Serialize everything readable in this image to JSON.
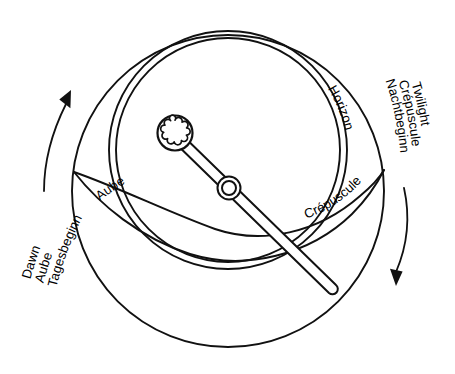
{
  "diagram": {
    "background_color": "#ffffff",
    "stroke_color": "#111111",
    "labels": {
      "horizon": "Horizon",
      "aube": "Aube",
      "crepuscule": "Crépuscule"
    },
    "left_group": {
      "line1": "Dawn",
      "line2": "Aube",
      "line3": "Tagesbeginn",
      "arrow_direction": "up"
    },
    "right_group": {
      "line1": "Twilight",
      "line2": "Crépuscule",
      "line3": "Nachtbeginn",
      "arrow_direction": "down"
    },
    "parts": {
      "outer_circle": "outer-circle",
      "horizon_ring": "horizon-ring",
      "twilight_band": "twilight-band",
      "pointer": "rule-pointer",
      "sun_marker": "sun-marker",
      "center_hub": "center-hub"
    }
  }
}
